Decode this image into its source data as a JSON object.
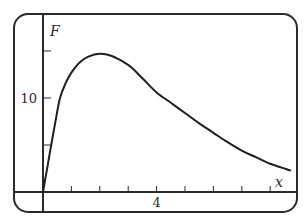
{
  "chart_data": {
    "type": "line",
    "title": "",
    "xlabel": "x",
    "ylabel": "F",
    "xlim": [
      0,
      8.9
    ],
    "ylim": [
      0,
      19
    ],
    "x_ticks": [
      1,
      2,
      3,
      4,
      5,
      6,
      7,
      8
    ],
    "x_tick_labels": [
      {
        "value": 4,
        "label": "4"
      }
    ],
    "y_ticks": [
      5,
      10,
      15
    ],
    "y_tick_labels": [
      {
        "value": 10,
        "label": "10"
      }
    ],
    "grid": false,
    "legend": "none",
    "series": [
      {
        "name": "F",
        "x": [
          0,
          0.15,
          0.29,
          0.45,
          0.6,
          0.8,
          1.0,
          1.3,
          1.6,
          2.0,
          2.4,
          2.8,
          3.1,
          3.5,
          4.0,
          4.5,
          5.0,
          5.5,
          6.0,
          6.5,
          7.0,
          7.5,
          8.0,
          8.4,
          8.7
        ],
        "values": [
          0,
          2.6,
          5.0,
          7.7,
          10.0,
          11.6,
          12.7,
          13.8,
          14.4,
          14.7,
          14.5,
          13.9,
          13.3,
          12.1,
          10.6,
          9.5,
          8.4,
          7.3,
          6.3,
          5.3,
          4.4,
          3.7,
          3.0,
          2.6,
          2.3
        ]
      }
    ]
  }
}
